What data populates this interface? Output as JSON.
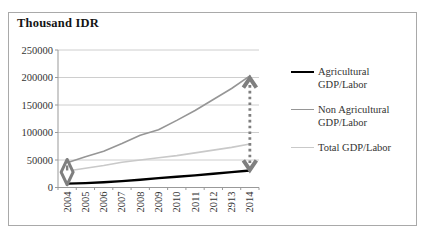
{
  "title": "Thousand IDR",
  "colors": {
    "background": "#ffffff",
    "frame_border": "#a9a9a9",
    "axis": "#999999",
    "gridline": "#c8c8c8",
    "text": "#333333",
    "annotation": "#7f7f7f"
  },
  "chart_data": {
    "type": "line",
    "title": "Thousand IDR",
    "x": [
      2004,
      2005,
      2006,
      2007,
      2008,
      2009,
      2010,
      2011,
      2012,
      2013,
      2014
    ],
    "x_tick_labels": [
      "2004",
      "2005",
      "2006",
      "2007",
      "2008",
      "2009",
      "2010",
      "2011",
      "2012",
      "2913",
      "2014"
    ],
    "y_ticks": [
      0,
      50000,
      100000,
      150000,
      200000,
      250000
    ],
    "y_tick_labels": [
      "0",
      "50000",
      "100000",
      "150000",
      "200000",
      "250000"
    ],
    "ylim": [
      0,
      250000
    ],
    "grid": true,
    "legend_position": "right",
    "series": [
      {
        "name": "Agricultural GDP/Labor",
        "color": "#000000",
        "width": 2.4,
        "values": [
          7000,
          8000,
          9500,
          11500,
          14000,
          17000,
          19500,
          22000,
          25000,
          28000,
          31000
        ]
      },
      {
        "name": "Non Agricultural GDP/Labor",
        "color": "#969696",
        "width": 1.6,
        "values": [
          45000,
          56000,
          66000,
          80000,
          95000,
          105000,
          122000,
          140000,
          160000,
          180000,
          203000
        ]
      },
      {
        "name": "Total GDP/Labor",
        "color": "#c9c9c9",
        "width": 1.6,
        "values": [
          30000,
          35000,
          40000,
          46000,
          50000,
          54000,
          58000,
          63000,
          68000,
          73000,
          79000
        ]
      }
    ],
    "annotations": [
      {
        "type": "diamond-double-arrow",
        "x_index": 0,
        "y_from": 5000,
        "y_to": 51000,
        "color": "#7f7f7f"
      },
      {
        "type": "dotted-double-arrow",
        "x_index": 10,
        "y_from": 32000,
        "y_to": 199000,
        "color": "#7f7f7f"
      }
    ]
  },
  "legend": {
    "items": [
      {
        "lines": [
          "Agricultural",
          "GDP/Labor"
        ]
      },
      {
        "lines": [
          "Non Agricultural",
          "GDP/Labor"
        ]
      },
      {
        "lines": [
          "Total GDP/Labor"
        ]
      }
    ]
  }
}
